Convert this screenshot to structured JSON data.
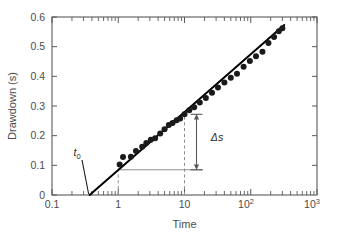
{
  "chart_data": {
    "type": "scatter",
    "title": "",
    "xlabel": "Time",
    "ylabel": "Drawdown (s)",
    "xscale": "log",
    "yscale": "linear",
    "xlim": [
      0.1,
      1000
    ],
    "ylim": [
      0,
      0.6
    ],
    "grid": false,
    "legend": null,
    "xticklabels": [
      "0.1",
      "1",
      "10",
      "10²",
      "10³"
    ],
    "xtickvalues": [
      0.1,
      1,
      10,
      100,
      1000
    ],
    "yticklabels": [
      "0",
      "0.1",
      "0.2",
      "0.3",
      "0.4",
      "0.5",
      "0.6"
    ],
    "ytickvalues": [
      0,
      0.1,
      0.2,
      0.3,
      0.4,
      0.5,
      0.6
    ],
    "series": [
      {
        "name": "drawdown observations",
        "marker": "filled-circle",
        "color": "#1a1a1a",
        "points": [
          {
            "x": 1.05,
            "y": 0.103
          },
          {
            "x": 1.18,
            "y": 0.128
          },
          {
            "x": 1.55,
            "y": 0.129
          },
          {
            "x": 1.85,
            "y": 0.148
          },
          {
            "x": 2.3,
            "y": 0.163
          },
          {
            "x": 2.65,
            "y": 0.175
          },
          {
            "x": 3.1,
            "y": 0.186
          },
          {
            "x": 3.6,
            "y": 0.191
          },
          {
            "x": 4.3,
            "y": 0.207
          },
          {
            "x": 5.0,
            "y": 0.222
          },
          {
            "x": 5.8,
            "y": 0.236
          },
          {
            "x": 6.6,
            "y": 0.243
          },
          {
            "x": 7.6,
            "y": 0.252
          },
          {
            "x": 8.6,
            "y": 0.258
          },
          {
            "x": 10.0,
            "y": 0.272
          },
          {
            "x": 11.8,
            "y": 0.286
          },
          {
            "x": 14.0,
            "y": 0.296
          },
          {
            "x": 17.0,
            "y": 0.312
          },
          {
            "x": 21.0,
            "y": 0.327
          },
          {
            "x": 26.0,
            "y": 0.345
          },
          {
            "x": 32.0,
            "y": 0.362
          },
          {
            "x": 40.0,
            "y": 0.379
          },
          {
            "x": 50.0,
            "y": 0.395
          },
          {
            "x": 62.0,
            "y": 0.409
          },
          {
            "x": 78.0,
            "y": 0.432
          },
          {
            "x": 97.0,
            "y": 0.452
          },
          {
            "x": 120.0,
            "y": 0.468
          },
          {
            "x": 150.0,
            "y": 0.483
          },
          {
            "x": 185.0,
            "y": 0.512
          },
          {
            "x": 225.0,
            "y": 0.533
          },
          {
            "x": 265.0,
            "y": 0.552
          },
          {
            "x": 300.0,
            "y": 0.562
          }
        ]
      }
    ],
    "fit_line": {
      "name": "straight-line fit",
      "x_intercept": 0.37,
      "points": [
        {
          "x": 0.37,
          "y": 0.0
        },
        {
          "x": 320.0,
          "y": 0.573
        }
      ]
    },
    "annotations": [
      {
        "name": "t0",
        "label": "t",
        "sublabel": "0",
        "x": 0.37,
        "y": 0.0,
        "note": "intercept of fit line with zero drawdown"
      },
      {
        "name": "delta-s",
        "label": "Δs",
        "x_from": 1,
        "x_to": 10,
        "y_from": 0.085,
        "y_to": 0.272,
        "note": "drawdown change per log cycle"
      }
    ],
    "guides": [
      {
        "name": "dashed-t1",
        "type": "vertical-dashed",
        "x": 1.0,
        "y_from": 0.0,
        "y_to": 0.105
      },
      {
        "name": "dashed-t10",
        "type": "vertical-dashed",
        "x": 10.0,
        "y_from": 0.0,
        "y_to": 0.278
      },
      {
        "name": "solid-horizontal",
        "type": "horizontal-solid",
        "y": 0.085,
        "x_from": 1.0,
        "x_to": 19.0
      }
    ]
  },
  "axes": {
    "ylabel": "Drawdown (s)",
    "xlabel": "Time",
    "ytick_0": "0",
    "ytick_1": "0.1",
    "ytick_2": "0.2",
    "ytick_3": "0.3",
    "ytick_4": "0.4",
    "ytick_5": "0.5",
    "ytick_6": "0.6",
    "xtick_0": "0.1",
    "xtick_1": "1",
    "xtick_2": "10",
    "xtick_3_base": "10",
    "xtick_3_exp": "2",
    "xtick_4_base": "10",
    "xtick_4_exp": "3"
  },
  "annotations": {
    "t0_base": "t",
    "t0_sub": "0",
    "delta_s": "Δs"
  },
  "colors": {
    "axis": "#58595b",
    "data": "#1a1a1a",
    "guide": "#8d8e90",
    "background": "#ffffff",
    "text": "#4b4b4d"
  }
}
